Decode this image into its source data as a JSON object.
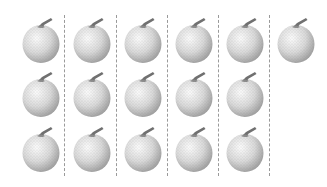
{
  "figure": {
    "object_icon": "melon-icon",
    "columns": 6,
    "rows": [
      {
        "row": 1,
        "count": 6
      },
      {
        "row": 2,
        "count": 5
      },
      {
        "row": 3,
        "count": 5
      }
    ],
    "total_count": 16,
    "colors": {
      "fruit_light": "#f2f2f2",
      "fruit_dark": "#9c9c9c",
      "stem": "#707070",
      "divider": "#9a9a9a"
    }
  }
}
